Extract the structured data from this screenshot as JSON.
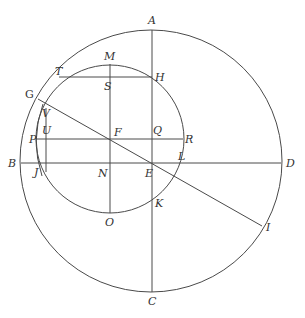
{
  "diagram": {
    "type": "geometric-construction",
    "stroke_color": "#4a4a4a",
    "label_color": "#333333",
    "circles": [
      {
        "name": "large-circle",
        "cx": 151,
        "cy": 161,
        "r": 131
      },
      {
        "name": "small-circle",
        "cx": 110,
        "cy": 139,
        "r": 74
      }
    ],
    "lines": [
      {
        "name": "line-AC",
        "x1": 152,
        "y1": 30,
        "x2": 152,
        "y2": 292
      },
      {
        "name": "line-BD",
        "x1": 21,
        "y1": 163,
        "x2": 281,
        "y2": 163
      },
      {
        "name": "line-MO",
        "x1": 110,
        "y1": 64,
        "x2": 110,
        "y2": 213
      },
      {
        "name": "line-TH",
        "x1": 59,
        "y1": 77,
        "x2": 152,
        "y2": 77
      },
      {
        "name": "line-PR",
        "x1": 36,
        "y1": 139,
        "x2": 183,
        "y2": 139
      },
      {
        "name": "line-GI",
        "x1": 38,
        "y1": 99,
        "x2": 262,
        "y2": 226
      },
      {
        "name": "line-VJ",
        "x1": 46,
        "y1": 108,
        "x2": 46,
        "y2": 172
      }
    ],
    "arcs": [
      {
        "name": "arc-GUJ",
        "d": "M 43 104 Q 30 140 42 176"
      }
    ],
    "labels": {
      "A": {
        "text": "A",
        "x": 148,
        "y": 24
      },
      "B": {
        "text": "B",
        "x": 8,
        "y": 167
      },
      "C": {
        "text": "C",
        "x": 148,
        "y": 305
      },
      "D": {
        "text": "D",
        "x": 286,
        "y": 167
      },
      "E": {
        "text": "E",
        "x": 145,
        "y": 177
      },
      "F": {
        "text": "F",
        "x": 114,
        "y": 136
      },
      "G": {
        "text": "G",
        "x": 25,
        "y": 98
      },
      "H": {
        "text": "H",
        "x": 155,
        "y": 81
      },
      "I": {
        "text": "I",
        "x": 266,
        "y": 231
      },
      "J": {
        "text": "J",
        "x": 34,
        "y": 176
      },
      "K": {
        "text": "K",
        "x": 155,
        "y": 207
      },
      "L": {
        "text": "L",
        "x": 178,
        "y": 160
      },
      "M": {
        "text": "M",
        "x": 104,
        "y": 60
      },
      "N": {
        "text": "N",
        "x": 98,
        "y": 177
      },
      "O": {
        "text": "O",
        "x": 105,
        "y": 226
      },
      "P": {
        "text": "P",
        "x": 29,
        "y": 143
      },
      "Q": {
        "text": "Q",
        "x": 153,
        "y": 134
      },
      "R": {
        "text": "R",
        "x": 185,
        "y": 143
      },
      "S": {
        "text": "S",
        "x": 104,
        "y": 90
      },
      "T": {
        "text": "T",
        "x": 55,
        "y": 75
      },
      "U": {
        "text": "U",
        "x": 42,
        "y": 134
      },
      "V": {
        "text": "V",
        "x": 42,
        "y": 117
      }
    }
  }
}
